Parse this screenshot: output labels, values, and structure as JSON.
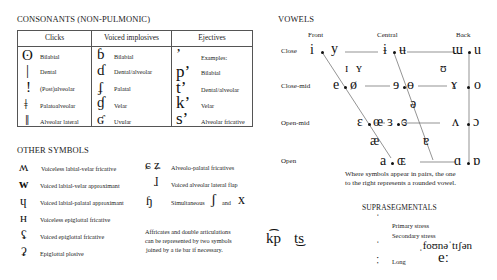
{
  "consonants": {
    "title": "CONSONANTS (NON-PULMONIC)",
    "headers": [
      "Clicks",
      "Voiced implosives",
      "Ejectives"
    ],
    "clicks": [
      {
        "symbol": "ʘ",
        "label": "Bilabial"
      },
      {
        "symbol": "|",
        "label": "Dental"
      },
      {
        "symbol": "!",
        "label": "(Post)alveolar"
      },
      {
        "symbol": "ǂ",
        "label": "Palatoalveolar"
      },
      {
        "symbol": "ǁ",
        "label": "Alveolar lateral"
      }
    ],
    "implosives": [
      {
        "symbol": "ɓ",
        "label": "Bilabial"
      },
      {
        "symbol": "ɗ",
        "label": "Dental/alveolar"
      },
      {
        "symbol": "ʄ",
        "label": "Palatal"
      },
      {
        "symbol": "ɠ",
        "label": "Velar"
      },
      {
        "symbol": "ʛ",
        "label": "Uvular"
      }
    ],
    "ejectives": [
      {
        "symbol": "ʼ",
        "label": "Examples:"
      },
      {
        "symbol": "pʼ",
        "label": "Bilabial"
      },
      {
        "symbol": "tʼ",
        "label": "Dental/alveolar"
      },
      {
        "symbol": "kʼ",
        "label": "Velar"
      },
      {
        "symbol": "sʼ",
        "label": "Alveolar fricative"
      }
    ]
  },
  "vowels": {
    "title": "VOWELS",
    "columns": [
      "Front",
      "Central",
      "Back"
    ],
    "rows": [
      "Close",
      "Close-mid",
      "Open-mid",
      "Open"
    ],
    "close": {
      "front_u": "i",
      "front_r": "y",
      "central_u": "ɨ",
      "central_r": "ʉ",
      "back_u": "ɯ",
      "back_r": "u"
    },
    "near_close": {
      "front_u": "ɪ",
      "front_r": "ʏ",
      "back_r": "ʊ"
    },
    "close_mid": {
      "front_u": "e",
      "front_r": "ø",
      "central_u": "ɘ",
      "central_r": "ɵ",
      "back_u": "ɤ",
      "back_r": "o"
    },
    "mid": {
      "central": "ə"
    },
    "open_mid": {
      "front_u": "ɛ",
      "front_r": "œ",
      "central_u": "ɜ",
      "central_r": "ɞ",
      "back_u": "ʌ",
      "back_r": "ɔ"
    },
    "near_open": {
      "front": "æ",
      "central": "ɐ"
    },
    "open": {
      "front_u": "a",
      "front_r": "ɶ",
      "back_u": "ɑ",
      "back_r": "ɒ"
    },
    "note_line1": "Where symbols appear in pairs, the one",
    "note_line2": "to the right represents a rounded vowel."
  },
  "other_symbols": {
    "title": "OTHER SYMBOLS",
    "left": [
      {
        "symbol": "ʍ",
        "label": "Voiceless labial-velar fricative"
      },
      {
        "symbol": "w",
        "label": "Voiced labial-velar approximant"
      },
      {
        "symbol": "ɥ",
        "label": "Voiced labial-palatal approximant"
      },
      {
        "symbol": "ʜ",
        "label": "Voiceless epiglottal fricative"
      },
      {
        "symbol": "ʢ",
        "label": "Voiced epiglottal fricative"
      },
      {
        "symbol": "ʡ",
        "label": "Epiglottal plosive"
      }
    ],
    "right": [
      {
        "symbol": "ɕ ʑ",
        "label": "Alveolo-palatal fricatives"
      },
      {
        "symbol": "ɺ",
        "label": "Voiced alveolar lateral flap"
      },
      {
        "symbol": "ɧ",
        "label": "Simultaneous",
        "sym2": "ʃ",
        "and": "and",
        "sym3": "x"
      }
    ],
    "affricate_note": [
      "Affricates and double articulations",
      "can be represented by two symbols",
      "joined by a tie bar if necessary."
    ],
    "tie_examples": [
      "k͡p",
      "t͜s"
    ]
  },
  "suprasegmentals": {
    "title": "SUPRASEGMENTALS",
    "items": [
      {
        "symbol": "ˈ",
        "label": "Primary stress"
      },
      {
        "symbol": "ˌ",
        "label": "Secondary stress"
      },
      {
        "symbol": "ː",
        "label": "Long"
      }
    ],
    "example": "ˌfoʊnəˈtɪʃən",
    "long_example": "eː"
  }
}
